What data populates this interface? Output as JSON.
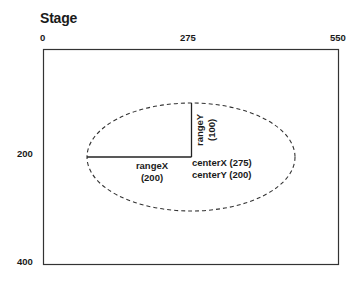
{
  "title": "Stage",
  "axes": {
    "x_ticks": [
      "0",
      "275",
      "550"
    ],
    "y_ticks": [
      "200",
      "400"
    ]
  },
  "labels": {
    "rangeY_name": "rangeY",
    "rangeY_value": "(100)",
    "rangeX_name": "rangeX",
    "rangeX_value": "(200)",
    "centerX": "centerX (275)",
    "centerY": "centerY (200)"
  },
  "colors": {
    "stroke": "#333333",
    "text": "#1a1a1a",
    "background": "#ffffff"
  }
}
